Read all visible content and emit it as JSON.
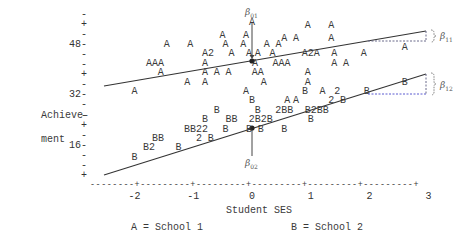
{
  "chart_data": {
    "type": "scatter",
    "title": "",
    "xlabel": "Student SES",
    "ylabel": "Achieve-\nment",
    "xlim": [
      -2.5,
      3
    ],
    "ylim": [
      8,
      56
    ],
    "x_ticks": [
      "-2",
      "-1",
      "0",
      "1",
      "2",
      "3"
    ],
    "y_ticks": [
      "48",
      "32",
      "16"
    ],
    "y_tick_marks": [
      "-",
      "+",
      "-",
      "48-",
      "-",
      "-",
      "+",
      "-",
      "32-",
      "-",
      "-",
      "+",
      "-",
      "16-",
      "-",
      "-",
      "+"
    ],
    "legend": [
      {
        "symbol": "A",
        "label": "School 1"
      },
      {
        "symbol": "B",
        "label": "School 2"
      }
    ],
    "legend_text": [
      "A = School 1",
      "B = School 2"
    ],
    "series": [
      {
        "name": "School 1",
        "symbol": "A",
        "regression_line": {
          "x": [
            -2.5,
            3.0
          ],
          "y": [
            33.5,
            51.0
          ]
        },
        "intercept_label": "β01",
        "slope_label": "β11",
        "points": [
          {
            "x": 0.95,
            "y": 54,
            "label": "A"
          },
          {
            "x": 1.35,
            "y": 54,
            "label": "A"
          },
          {
            "x": 0.0,
            "y": 55,
            "label": "A"
          },
          {
            "x": -0.5,
            "y": 51,
            "label": "A"
          },
          {
            "x": 0.55,
            "y": 50,
            "label": "A"
          },
          {
            "x": 0.75,
            "y": 50,
            "label": "A"
          },
          {
            "x": 1.35,
            "y": 50,
            "label": "A"
          },
          {
            "x": -0.1,
            "y": 51,
            "label": "A"
          },
          {
            "x": -1.45,
            "y": 48,
            "label": "A"
          },
          {
            "x": -1.05,
            "y": 48,
            "label": "A"
          },
          {
            "x": -0.45,
            "y": 48,
            "label": "A"
          },
          {
            "x": -0.15,
            "y": 48,
            "label": "A"
          },
          {
            "x": 0.25,
            "y": 48,
            "label": "A"
          },
          {
            "x": 0.45,
            "y": 48,
            "label": "A"
          },
          {
            "x": -0.75,
            "y": 45,
            "label": "A2"
          },
          {
            "x": -0.35,
            "y": 45,
            "label": "A"
          },
          {
            "x": -0.05,
            "y": 45,
            "label": "A"
          },
          {
            "x": 0.1,
            "y": 45,
            "label": "A"
          },
          {
            "x": 0.35,
            "y": 45,
            "label": "A"
          },
          {
            "x": 1.0,
            "y": 45,
            "label": "A2A"
          },
          {
            "x": 1.4,
            "y": 45,
            "label": "A"
          },
          {
            "x": 1.9,
            "y": 45,
            "label": "A"
          },
          {
            "x": 2.6,
            "y": 47,
            "label": "A"
          },
          {
            "x": -1.65,
            "y": 42,
            "label": "AAA"
          },
          {
            "x": -0.8,
            "y": 42,
            "label": "A"
          },
          {
            "x": 0.05,
            "y": 42,
            "label": "A"
          },
          {
            "x": 0.5,
            "y": 42,
            "label": "AAA"
          },
          {
            "x": 1.4,
            "y": 42,
            "label": "A"
          },
          {
            "x": 1.6,
            "y": 42,
            "label": "A"
          },
          {
            "x": -1.55,
            "y": 39,
            "label": "A"
          },
          {
            "x": -0.8,
            "y": 39,
            "label": "A"
          },
          {
            "x": -0.6,
            "y": 39,
            "label": "A"
          },
          {
            "x": -0.4,
            "y": 39,
            "label": "A"
          },
          {
            "x": 0.1,
            "y": 39,
            "label": "AA"
          },
          {
            "x": 0.95,
            "y": 39,
            "label": "A"
          },
          {
            "x": -1.1,
            "y": 36,
            "label": "A"
          },
          {
            "x": -0.8,
            "y": 36,
            "label": "A"
          },
          {
            "x": 0.2,
            "y": 36,
            "label": "A"
          },
          {
            "x": 0.95,
            "y": 36,
            "label": "A"
          },
          {
            "x": -2.0,
            "y": 33,
            "label": "A"
          },
          {
            "x": -0.1,
            "y": 33,
            "label": "A"
          },
          {
            "x": 0.75,
            "y": 30,
            "label": "A"
          },
          {
            "x": 1.2,
            "y": 33,
            "label": "A"
          }
        ]
      },
      {
        "name": "School 2",
        "symbol": "B",
        "regression_line": {
          "x": [
            -2.5,
            3.0
          ],
          "y": [
            11.0,
            36.0
          ]
        },
        "intercept_label": "β02",
        "slope_label": "β12",
        "points": [
          {
            "x": 2.6,
            "y": 36,
            "label": "B"
          },
          {
            "x": 0.9,
            "y": 33,
            "label": "B"
          },
          {
            "x": 1.45,
            "y": 33,
            "label": "2"
          },
          {
            "x": 1.95,
            "y": 33,
            "label": "B"
          },
          {
            "x": 0.0,
            "y": 30,
            "label": "B"
          },
          {
            "x": 0.6,
            "y": 30,
            "label": "A"
          },
          {
            "x": 1.35,
            "y": 30,
            "label": "2"
          },
          {
            "x": 1.55,
            "y": 30,
            "label": "B"
          },
          {
            "x": -0.6,
            "y": 27,
            "label": "B"
          },
          {
            "x": 0.1,
            "y": 27,
            "label": "B"
          },
          {
            "x": 0.55,
            "y": 27,
            "label": "2BB"
          },
          {
            "x": 1.1,
            "y": 27,
            "label": "B2BB"
          },
          {
            "x": -0.8,
            "y": 24,
            "label": "B"
          },
          {
            "x": -0.35,
            "y": 24,
            "label": "BB"
          },
          {
            "x": 0.15,
            "y": 24,
            "label": "2B2B"
          },
          {
            "x": 1.0,
            "y": 24,
            "label": "B"
          },
          {
            "x": -0.05,
            "y": 21,
            "label": "B"
          },
          {
            "x": 0.15,
            "y": 21,
            "label": "B"
          },
          {
            "x": 0.55,
            "y": 21,
            "label": "B"
          },
          {
            "x": -0.95,
            "y": 21,
            "label": "BB22"
          },
          {
            "x": -0.45,
            "y": 21,
            "label": "B"
          },
          {
            "x": -0.9,
            "y": 18,
            "label": "2"
          },
          {
            "x": -0.7,
            "y": 18,
            "label": "B"
          },
          {
            "x": -1.6,
            "y": 18,
            "label": "BB"
          },
          {
            "x": -1.75,
            "y": 15,
            "label": "B2"
          },
          {
            "x": -1.25,
            "y": 15,
            "label": "B"
          },
          {
            "x": -2.0,
            "y": 12,
            "label": "B"
          }
        ]
      }
    ],
    "annotations": [
      "β01",
      "β02",
      "β11",
      "β12"
    ],
    "grid": false,
    "legend_position": "bottom"
  }
}
